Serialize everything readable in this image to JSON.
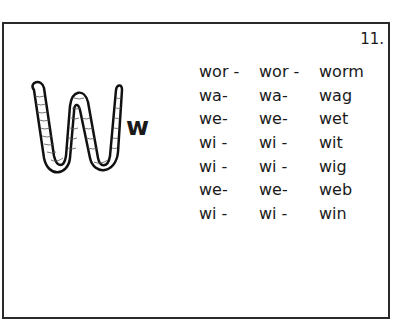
{
  "page_number": "11.",
  "letter": "w",
  "picture": "worm",
  "rows": [
    {
      "col1": "wor -",
      "col2": "wor -",
      "col3": "worm"
    },
    {
      "col1": "wa-",
      "col2": "wa-",
      "col3": "wag"
    },
    {
      "col1": "we-",
      "col2": "we-",
      "col3": "wet"
    },
    {
      "col1": "wi -",
      "col2": "wi -",
      "col3": "wit"
    },
    {
      "col1": "wi -",
      "col2": "wi -",
      "col3": "wig"
    },
    {
      "col1": "we-",
      "col2": "we-",
      "col3": "web"
    },
    {
      "col1": "wi -",
      "col2": "wi -",
      "col3": "win"
    }
  ]
}
